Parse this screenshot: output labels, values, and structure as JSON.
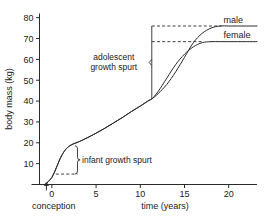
{
  "chart_data": {
    "type": "line",
    "title": "",
    "xlabel": "time (years)",
    "ylabel": "body mass (kg)",
    "xlim": [
      -1.4,
      23.2
    ],
    "ylim": [
      0,
      82
    ],
    "grid": false,
    "legend_position": "right-end-of-lines",
    "xticks": [
      0,
      5,
      10,
      15,
      20
    ],
    "xtick_labels": [
      "0",
      "5",
      "10",
      "15",
      "20"
    ],
    "yticks": [
      10,
      20,
      30,
      40,
      50,
      60,
      70,
      80
    ],
    "ytick_labels": [
      "10",
      "20",
      "30",
      "40",
      "50",
      "60",
      "70",
      "80"
    ],
    "origin_marker_label": "conception",
    "series": [
      {
        "name": "male",
        "label": "male",
        "plateau_value": 76,
        "x": [
          -0.75,
          0,
          0.5,
          1,
          1.5,
          2,
          2.5,
          3,
          4,
          5,
          6,
          7,
          8,
          9,
          10,
          11,
          11.3,
          12,
          13,
          14,
          15,
          16,
          17,
          18,
          19,
          20,
          21,
          22,
          23.2
        ],
        "y": [
          0,
          3.4,
          8,
          13,
          16.5,
          18.5,
          19.6,
          20.4,
          22.4,
          24.6,
          27,
          29.6,
          32.2,
          35,
          37.6,
          40.4,
          41,
          43.5,
          48,
          54,
          61,
          68,
          72.5,
          75,
          76,
          76,
          76,
          76,
          76
        ]
      },
      {
        "name": "female",
        "label": "female",
        "plateau_value": 68.5,
        "x": [
          -0.75,
          0,
          0.5,
          1,
          1.5,
          2,
          2.5,
          3,
          4,
          5,
          6,
          7,
          8,
          9,
          10,
          11,
          11.3,
          12,
          13,
          14,
          15,
          16,
          17,
          18,
          19,
          20,
          21,
          22,
          23.2
        ],
        "y": [
          0,
          3.4,
          8,
          13,
          16.5,
          18.5,
          19.6,
          20.4,
          22.4,
          24.6,
          27,
          29.6,
          32.2,
          35,
          37.6,
          40.4,
          41,
          44.5,
          51,
          57.5,
          62.5,
          66,
          68,
          68.5,
          68.5,
          68.5,
          68.5,
          68.5,
          68.5
        ]
      }
    ],
    "annotations": [
      {
        "name": "adolescent-growth-spurt",
        "text_line1": "adolescent",
        "text_line2": "growth spurt",
        "bracket_x": 11.3,
        "bracket_y_bottom": 41,
        "bracket_y_top": 76,
        "dashed_level_male": 76,
        "dashed_level_female": 68.5
      },
      {
        "name": "infant-growth-spurt",
        "text": "infant growth spurt",
        "brace_x": 2.9,
        "brace_y_bottom": 5,
        "brace_y_top": 18.6,
        "dashed_level": 5,
        "dashed_x_start": 0.45
      }
    ]
  }
}
